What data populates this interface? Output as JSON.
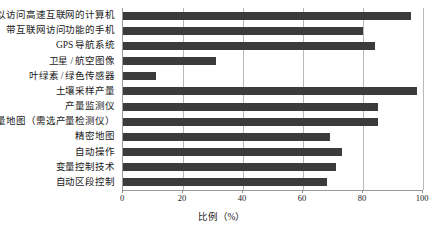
{
  "chart_data": {
    "type": "bar",
    "orientation": "horizontal",
    "title": "",
    "subtitle": "",
    "xlabel": "比例（%）",
    "ylabel": "",
    "xlim": [
      0,
      100
    ],
    "xticks": [
      0,
      20,
      40,
      60,
      80,
      100
    ],
    "xtick_labels": [
      "0",
      "20",
      "40",
      "60",
      "80",
      "100"
    ],
    "grid": true,
    "grid_axis": "x",
    "legend": null,
    "legend_position": "none",
    "bar_color": "#3b3b3b",
    "axis_color": "#9a9a9a",
    "categories": [
      "可以访问高速互联网的计算机",
      "带互联网访问功能的手机",
      "GPS 导航系统",
      "卫星 / 航空图像",
      "叶绿素 / 绿色传感器",
      "土壤采样产量",
      "产量监测仪",
      "产量地图（需选产量检测仪）",
      "精密地图",
      "自动操作",
      "变量控制技术",
      "自动区段控制"
    ],
    "values": [
      96,
      80,
      84,
      31,
      11,
      98,
      85,
      85,
      69,
      73,
      71,
      68
    ]
  }
}
